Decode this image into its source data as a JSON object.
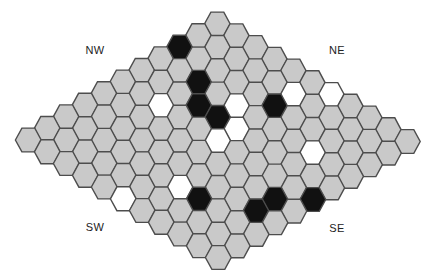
{
  "board": {
    "size": 11,
    "colors": {
      "empty": "#c9c9c9",
      "black": "#111111",
      "white": "#ffffff",
      "stroke": "#4d4d4d"
    },
    "stones": {
      "black": [
        [
          2,
          0
        ],
        [
          3,
          2
        ],
        [
          4,
          3
        ],
        [
          4,
          4
        ],
        [
          2,
          5
        ],
        [
          8,
          7
        ],
        [
          6,
          9
        ],
        [
          7,
          9
        ],
        [
          5,
          10
        ]
      ],
      "white": [
        [
          5,
          2
        ],
        [
          3,
          4
        ],
        [
          4,
          5
        ],
        [
          5,
          5
        ],
        [
          1,
          5
        ],
        [
          0,
          6
        ],
        [
          3,
          8
        ],
        [
          8,
          6
        ],
        [
          10,
          5
        ]
      ]
    }
  },
  "labels": {
    "nw": "NW",
    "ne": "NE",
    "sw": "SW",
    "se": "SE"
  }
}
